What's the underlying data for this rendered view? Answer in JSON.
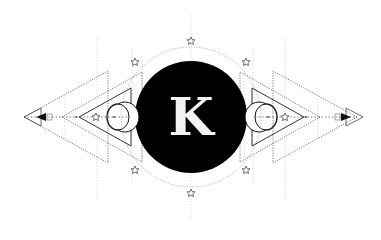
{
  "logo": {
    "monogram": "K",
    "colors": {
      "background": "#ffffff",
      "circle": "#000000",
      "letter": "#f2f2f2",
      "lines": "#333333",
      "dotted": "#888888",
      "guides": "#c8c8c8"
    },
    "elements": {
      "center_circle": "filled-black-circle",
      "outer_ring": "dotted-circle",
      "left_moon": "crescent-moon-icon",
      "right_moon": "crescent-moon-icon",
      "stars": "star-outline-icon",
      "arrows": "arrow-tip-icon"
    }
  }
}
